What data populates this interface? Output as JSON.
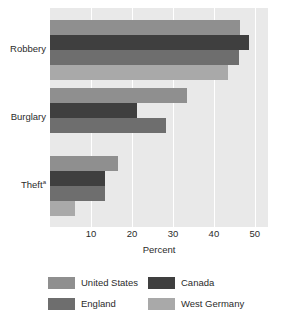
{
  "chart_data": {
    "type": "bar",
    "orientation": "horizontal",
    "title": "",
    "xlabel": "Percent",
    "ylabel": "",
    "categories": [
      "Robbery",
      "Burglary",
      "Theft"
    ],
    "category_footnotes": [
      "",
      "",
      "a"
    ],
    "series": [
      {
        "name": "United States",
        "color": "#8f8f8f",
        "values": [
          46.3,
          33.4,
          16.6
        ]
      },
      {
        "name": "Canada",
        "color": "#3f3f3f",
        "values": [
          48.5,
          21.2,
          13.4
        ]
      },
      {
        "name": "England",
        "color": "#6e6e6e",
        "values": [
          46.1,
          28.3,
          13.4
        ]
      },
      {
        "name": "West Germany",
        "color": "#a9a9a9",
        "values": [
          43.4,
          0,
          6.1
        ]
      }
    ],
    "xlim": [
      0,
      53.2
    ],
    "xticks": [
      10,
      20,
      30,
      40,
      50
    ],
    "xtick_labels": [
      "10",
      "20",
      "30",
      "40",
      "50"
    ],
    "grid": true,
    "grid_axis": "x",
    "legend_position": "bottom",
    "plot_background": "#e9e9e9",
    "gridline_color": "#ffffff"
  },
  "axis": {
    "x_title": "Percent"
  },
  "legend": {
    "items": [
      {
        "label": "United States"
      },
      {
        "label": "Canada"
      },
      {
        "label": "England"
      },
      {
        "label": "West Germany"
      }
    ]
  }
}
